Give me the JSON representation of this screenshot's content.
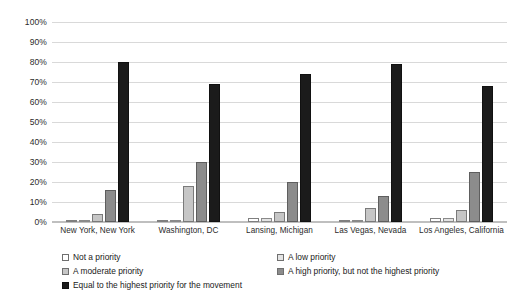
{
  "chart_data": {
    "type": "bar",
    "title": "",
    "subtitle": "",
    "xlabel": "",
    "ylabel": "",
    "ylim": [
      0,
      100
    ],
    "grid": true,
    "legend_position": "bottom",
    "categories": [
      "New York, New York",
      "Washington, DC",
      "Lansing, Michigan",
      "Las Vegas, Nevada",
      "Los Angeles, California"
    ],
    "y_ticks": [
      "0%",
      "10%",
      "20%",
      "30%",
      "40%",
      "50%",
      "60%",
      "70%",
      "80%",
      "90%",
      "100%"
    ],
    "y_tick_values": [
      0,
      10,
      20,
      30,
      40,
      50,
      60,
      70,
      80,
      90,
      100
    ],
    "series": [
      {
        "name": "Not a priority",
        "color": "#ffffff",
        "values": [
          0,
          0,
          2,
          1,
          2
        ]
      },
      {
        "name": "A low priority",
        "color": "#e4e4e4",
        "values": [
          1,
          0,
          2,
          1,
          2
        ]
      },
      {
        "name": "A moderate priority",
        "color": "#c6c6c6",
        "values": [
          4,
          18,
          5,
          7,
          6
        ]
      },
      {
        "name": "A high priority, but not the highest priority",
        "color": "#8c8c8c",
        "values": [
          16,
          30,
          20,
          13,
          25
        ]
      },
      {
        "name": "Equal to the highest priority for the movement",
        "color": "#1b1b1b",
        "values": [
          80,
          69,
          74,
          79,
          68
        ]
      }
    ]
  },
  "legend": {
    "items": [
      "Not a priority",
      "A low priority",
      "A moderate priority",
      "A high priority, but not the highest priority",
      "Equal to the highest priority for the movement"
    ]
  }
}
